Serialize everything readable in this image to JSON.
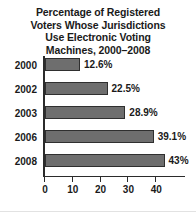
{
  "chart_data": {
    "type": "bar",
    "orientation": "horizontal",
    "title": "Percentage of Registered Voters Whose Jurisdictions Use Electronic Voting Machines, 2000–2008",
    "title_lines": [
      "Percentage of Registered",
      "Voters Whose Jurisdictions",
      "Use Electronic Voting",
      "Machines, 2000–2008"
    ],
    "categories": [
      "2000",
      "2002",
      "2003",
      "2006",
      "2008"
    ],
    "values": [
      12.6,
      22.5,
      28.9,
      39.1,
      43
    ],
    "data_labels": [
      "12.6%",
      "22.5%",
      "28.9%",
      "39.1%",
      "43%"
    ],
    "xlabel": "",
    "ylabel": "",
    "xlim": [
      0,
      50
    ],
    "x_ticks": [
      0,
      10,
      20,
      30,
      40
    ],
    "x_tick_labels": [
      "0",
      "10",
      "20",
      "30",
      "40"
    ],
    "grid": false,
    "legend": false,
    "bar_color": "#6e6e6e",
    "bar_border_color": "#2f2f2f",
    "axis_color": "#2b2b2b",
    "text_color": "#1a1a1a",
    "background": "#ffffff"
  }
}
